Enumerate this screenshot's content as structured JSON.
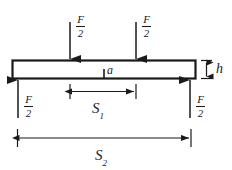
{
  "figure": {
    "line_color": "#1a1a1a",
    "beam_fill": "#ffffff",
    "background": "#ffffff"
  },
  "loads": {
    "left": {
      "numerator": "F",
      "denominator": "2",
      "direction": "down"
    },
    "right": {
      "numerator": "F",
      "denominator": "2",
      "direction": "down"
    }
  },
  "reactions": {
    "left": {
      "numerator": "F",
      "denominator": "2",
      "direction": "up"
    },
    "right": {
      "numerator": "F",
      "denominator": "2",
      "direction": "up"
    }
  },
  "dimensions": {
    "height": {
      "label": "h",
      "orientation": "vertical"
    },
    "notch": {
      "label": "a",
      "orientation": "vertical"
    },
    "inner_span": {
      "base": "S",
      "sub": "1",
      "orientation": "horizontal"
    },
    "outer_span": {
      "base": "S",
      "sub": "2",
      "orientation": "horizontal"
    }
  }
}
